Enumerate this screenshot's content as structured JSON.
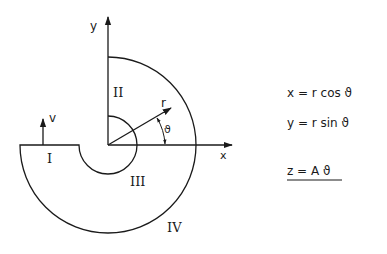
{
  "diagram": {
    "axes": {
      "x_label": "x",
      "y_label": "y"
    },
    "vectors": {
      "radial_label": "r",
      "angle_label": "ϑ",
      "velocity_label": "v"
    },
    "regions": [
      {
        "id": "I",
        "label": "I"
      },
      {
        "id": "II",
        "label": "II"
      },
      {
        "id": "III",
        "label": "III"
      },
      {
        "id": "IV",
        "label": "IV"
      }
    ],
    "equations": [
      {
        "label": "x = r cos ϑ"
      },
      {
        "label": "y = r sin ϑ"
      },
      {
        "label": "z = A ϑ",
        "underlined": true
      }
    ],
    "colors": {
      "stroke": "#1a1a1a",
      "background": "#ffffff"
    }
  }
}
